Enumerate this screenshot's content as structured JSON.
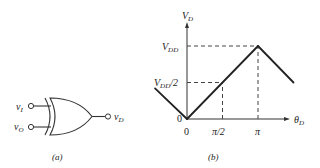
{
  "figure_a": {
    "caption": "(a)",
    "gate_type": "XOR",
    "inputs": [
      {
        "label": "v",
        "sub": "I"
      },
      {
        "label": "v",
        "sub": "O"
      }
    ],
    "output": {
      "label": "v",
      "sub": "D"
    }
  },
  "figure_b": {
    "caption": "(b)",
    "y_axis": {
      "label": "V",
      "sub": "D"
    },
    "x_axis": {
      "label": "θ",
      "sub": "D"
    },
    "y_ticks": [
      {
        "label": "V",
        "sub": "DD",
        "suffix": ""
      },
      {
        "label": "V",
        "sub": "DD",
        "suffix": "/2"
      },
      {
        "label": "0",
        "sub": "",
        "suffix": ""
      }
    ],
    "x_ticks": [
      "0",
      "π/2",
      "π"
    ],
    "curve": {
      "description": "Phase detector characteristic: V_D rises linearly from 0 at θ=0 to V_DD at θ=π, falls on either side",
      "points": [
        {
          "theta": -0.45,
          "v": 0.42
        },
        {
          "theta": 0,
          "v": 0
        },
        {
          "theta": 1.0,
          "v": 1.0
        },
        {
          "theta": 1.5,
          "v": 0.5
        }
      ],
      "theta_units": "π",
      "v_units": "V_DD"
    }
  },
  "chart_data": {
    "type": "line",
    "title": "",
    "xlabel": "θ_D",
    "ylabel": "V_D",
    "x_tick_labels": [
      "0",
      "π/2",
      "π"
    ],
    "y_tick_labels": [
      "0",
      "V_DD/2",
      "V_DD"
    ],
    "series": [
      {
        "name": "V_D vs θ_D",
        "x": [
          -0.45,
          0,
          1.0,
          1.5
        ],
        "y": [
          0.42,
          0,
          1.0,
          0.5
        ]
      }
    ],
    "reference_lines": [
      {
        "type": "horizontal",
        "y": 1.0,
        "to_x": 1.0,
        "style": "dashed"
      },
      {
        "type": "horizontal",
        "y": 0.5,
        "to_x": 0.5,
        "style": "dashed"
      },
      {
        "type": "vertical",
        "x": 0.5,
        "to_y": 0.5,
        "style": "dashed"
      },
      {
        "type": "vertical",
        "x": 1.0,
        "to_y": 1.0,
        "style": "dashed"
      }
    ],
    "x_units": "π rad",
    "y_units": "V_DD",
    "xlim": [
      -0.45,
      1.85
    ],
    "ylim": [
      0,
      1.2
    ],
    "grid": false
  }
}
